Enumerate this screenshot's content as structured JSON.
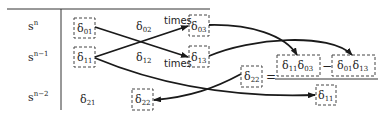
{
  "rows": [
    {
      "var": "s",
      "power": "n",
      "y": 30
    },
    {
      "var": "s",
      "power": "n−1",
      "y": 60
    },
    {
      "var": "s",
      "power": "n−2",
      "y": 101
    }
  ],
  "cells": [
    {
      "id": "d01",
      "base": "δ",
      "sub": "01",
      "boxed": true
    },
    {
      "id": "d02",
      "base": "δ",
      "sub": "02",
      "boxed": false
    },
    {
      "id": "d03",
      "base": "δ",
      "sub": "03",
      "boxed": true
    },
    {
      "id": "d11",
      "base": "δ",
      "sub": "11",
      "boxed": true
    },
    {
      "id": "d12",
      "base": "δ",
      "sub": "12",
      "boxed": false
    },
    {
      "id": "d13",
      "base": "δ",
      "sub": "13",
      "boxed": true
    },
    {
      "id": "d21",
      "base": "δ",
      "sub": "21",
      "boxed": false
    },
    {
      "id": "d22",
      "base": "δ",
      "sub": "22",
      "boxed": true
    }
  ],
  "times_labels": [
    "times",
    "times"
  ],
  "formula": {
    "lhs": {
      "base": "δ",
      "sub": "22"
    },
    "equals": "=",
    "numerator": {
      "term1": {
        "a": {
          "base": "δ",
          "sub": "11"
        },
        "b": {
          "base": "δ",
          "sub": "03"
        }
      },
      "minus": "−",
      "term2": {
        "a": {
          "base": "δ",
          "sub": "01"
        },
        "b": {
          "base": "δ",
          "sub": "13"
        }
      }
    },
    "denominator": {
      "base": "δ",
      "sub": "11"
    }
  },
  "colors": {
    "ink": "#1a1a1a",
    "box": "#444444",
    "background": "#ffffff"
  }
}
